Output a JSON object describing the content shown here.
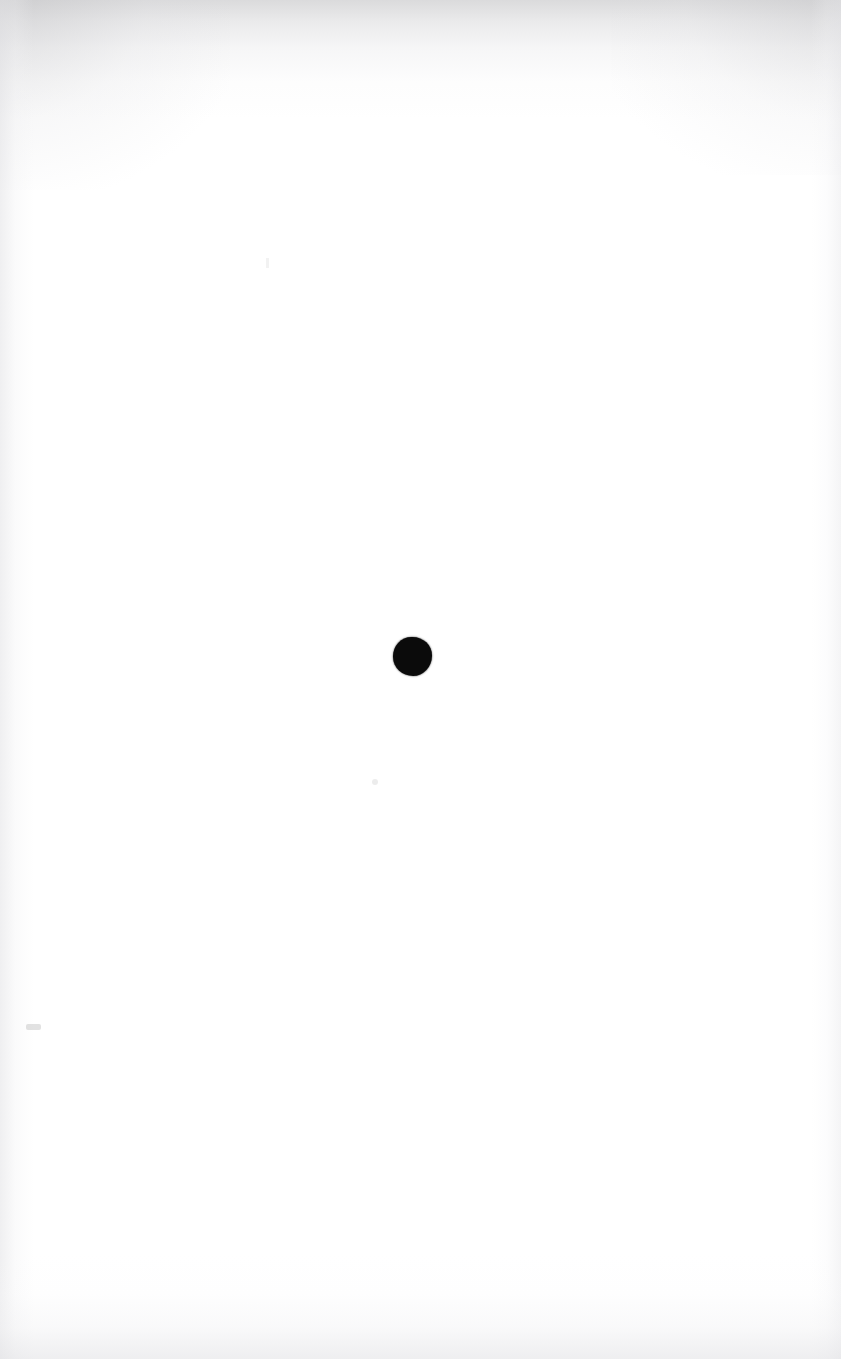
{
  "document": {
    "kind": "scanned-page",
    "title": "Blank scanned page",
    "page_width": 841,
    "page_height": 1359,
    "background_color": "#ffffff",
    "body_text": "",
    "note": "Page is blank apart from a single black ink mark near the center."
  },
  "marks": {
    "ink_dot": {
      "name": "ink-dot",
      "shape": "circle",
      "color": "#0b0b0b",
      "center_x": 412,
      "center_y": 656,
      "diameter": 39,
      "label": ""
    },
    "specks": [
      {
        "name": "speck-left-margin",
        "x": 26,
        "y": 1024,
        "color": "#969698"
      },
      {
        "name": "speck-center-lower",
        "x": 372,
        "y": 779,
        "color": "#a8a8aa"
      },
      {
        "name": "speck-upper-left",
        "x": 266,
        "y": 258,
        "color": "#c4c4c6"
      }
    ]
  },
  "scan_artifacts": {
    "top_band_color": "#c4c4c6",
    "left_band_color": "#e2e2e5",
    "right_band_color": "#e7e7ea",
    "bottom_band_color": "#e2e2e5",
    "corner_shade_color": "#babab D"
  }
}
